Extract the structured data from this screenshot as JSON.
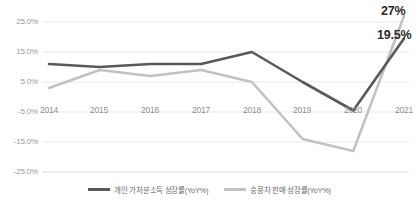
{
  "chart_data": {
    "type": "line",
    "title": "",
    "xlabel": "",
    "ylabel": "",
    "categories": [
      "2014",
      "2015",
      "2016",
      "2017",
      "2018",
      "2019",
      "2020",
      "2021"
    ],
    "ylim": [
      -25,
      25
    ],
    "ytick_labels": [
      "25.0%",
      "15.0%",
      "5.0%",
      "-5.0%",
      "-15.0%",
      "-25.0%"
    ],
    "ytick_values": [
      25,
      15,
      5,
      -5,
      -15,
      -25
    ],
    "grid": true,
    "legend_position": "bottom",
    "series": [
      {
        "name": "개인 가처분소득 성장률(YoY%)",
        "color": "#595959",
        "values": [
          11,
          10,
          11,
          11,
          15,
          5,
          -4.5,
          19.5
        ],
        "end_label": "19.5%"
      },
      {
        "name": "승용차 판매 성장률(YoY%)",
        "color": "#c2c2c2",
        "values": [
          3,
          9,
          7,
          9,
          5,
          -14,
          -18,
          27
        ],
        "end_label": "27%"
      }
    ],
    "annotations": [
      {
        "text": "27%",
        "series": "승용차 판매 성장률(YoY%)",
        "at": "2021"
      },
      {
        "text": "19.5%",
        "series": "개인 가처분소득 성장률(YoY%)",
        "at": "2021"
      }
    ]
  },
  "axis": {
    "y": {
      "t0": "25.0%",
      "t1": "15.0%",
      "t2": "5.0%",
      "t3": "-5.0%",
      "t4": "-15.0%",
      "t5": "-25.0%"
    },
    "x": {
      "t0": "2014",
      "t1": "2015",
      "t2": "2016",
      "t3": "2017",
      "t4": "2018",
      "t5": "2019",
      "t6": "2020",
      "t7": "2021"
    }
  },
  "labels": {
    "gray_end": "27%",
    "dark_end": "19.5%"
  },
  "legend": {
    "items": [
      {
        "label": "개인 가처분소득 성장률(YoY%)",
        "color": "#595959"
      },
      {
        "label": "승용차 판매 성장률(YoY%)",
        "color": "#c2c2c2"
      }
    ]
  },
  "colors": {
    "dark_line": "#595959",
    "light_line": "#c2c2c2",
    "grid": "#e8e8e8",
    "tick_text": "#9a9a9a",
    "label_text": "#2b2b2b"
  }
}
